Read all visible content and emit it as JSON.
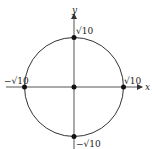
{
  "diagram": {
    "type": "circle-on-axes",
    "axes": {
      "x_label": "x",
      "y_label": "y"
    },
    "circle": {
      "center": "origin",
      "radius_label": "√10"
    },
    "points": [
      {
        "name": "top",
        "label": "√10"
      },
      {
        "name": "right",
        "label": "√10"
      },
      {
        "name": "left",
        "label": "−√10"
      },
      {
        "name": "bottom",
        "label": "−√10"
      },
      {
        "name": "origin",
        "label": ""
      }
    ],
    "colors": {
      "stroke": "#333333",
      "point": "#111111",
      "background": "#ffffff"
    }
  }
}
